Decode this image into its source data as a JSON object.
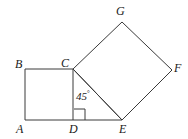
{
  "figure": {
    "background_color": "#ffffff",
    "stroke_color": "#3a3a3a",
    "stroke_width": 1,
    "label_color": "#1a1a1a",
    "canvas": {
      "width": 188,
      "height": 139
    },
    "vertices": [
      {
        "name": "A",
        "label": "A",
        "x": 25,
        "y": 120,
        "label_x": 16,
        "label_y": 123
      },
      {
        "name": "B",
        "label": "B",
        "x": 25,
        "y": 69,
        "label_x": 15,
        "label_y": 58
      },
      {
        "name": "C",
        "label": "C",
        "x": 73,
        "y": 69,
        "label_x": 61,
        "label_y": 57
      },
      {
        "name": "D",
        "label": "D",
        "x": 73,
        "y": 120,
        "label_x": 69,
        "label_y": 123
      },
      {
        "name": "E",
        "label": "E",
        "x": 122,
        "y": 120,
        "label_x": 119,
        "label_y": 123
      },
      {
        "name": "F",
        "label": "F",
        "x": 172,
        "y": 70,
        "label_x": 174,
        "label_y": 62
      },
      {
        "name": "G",
        "label": "G",
        "x": 122,
        "y": 22,
        "label_x": 116,
        "label_y": 5
      }
    ],
    "shapes": [
      {
        "name": "square-abcd",
        "type": "polygon",
        "points": "25,120 25,69 73,69 73,120"
      },
      {
        "name": "square-cgfe",
        "type": "polygon",
        "points": "73,69 122,22 172,70 122,120"
      }
    ],
    "segments": [
      {
        "name": "segment-ce-diagonal",
        "x1": 73,
        "y1": 69,
        "x2": 122,
        "y2": 120
      },
      {
        "name": "segment-de-base",
        "x1": 73,
        "y1": 120,
        "x2": 122,
        "y2": 120
      }
    ],
    "right_angle_marker": {
      "name": "right-angle-at-d",
      "vertex": "D",
      "path": "M 74 109 L 85 109 L 85 120"
    },
    "angle_annotations": [
      {
        "name": "angle-45-at-c",
        "value": "45",
        "unit": "°",
        "text": "45°",
        "x": 76,
        "y": 88
      }
    ]
  }
}
